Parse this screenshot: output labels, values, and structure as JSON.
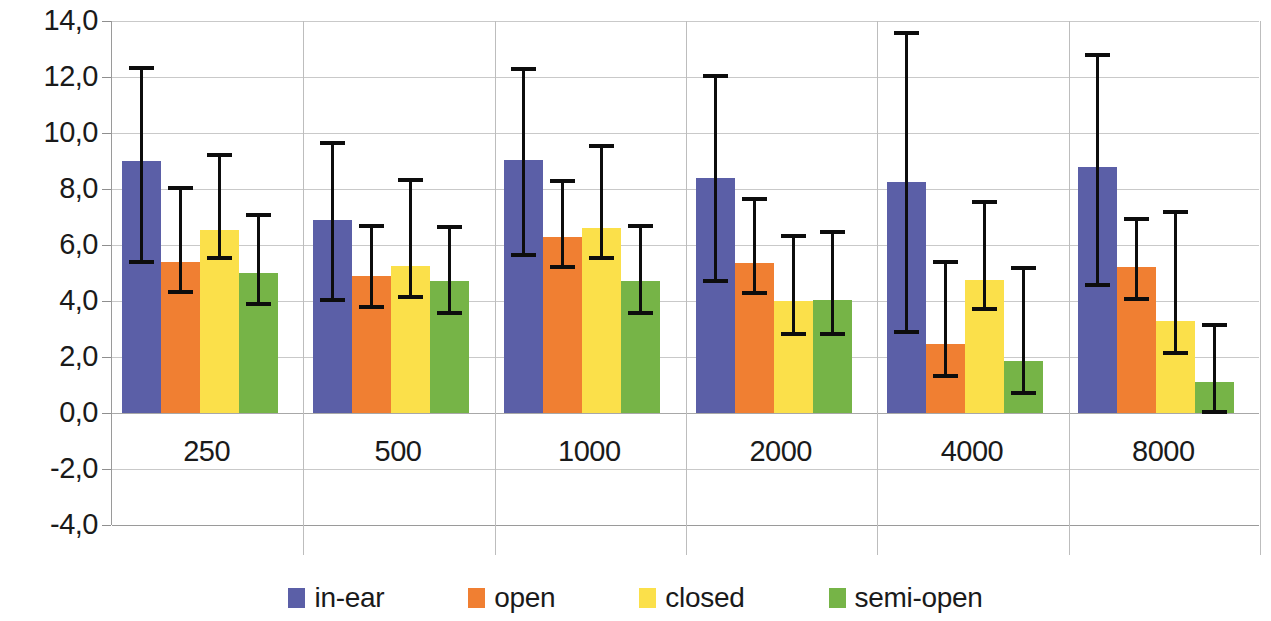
{
  "chart_data": {
    "type": "bar",
    "title": "",
    "subtitle": "",
    "xlabel": "",
    "ylabel": "",
    "categories": [
      "250",
      "500",
      "1000",
      "2000",
      "4000",
      "8000"
    ],
    "ylim": [
      -4.0,
      14.0
    ],
    "ytick_step": 2.0,
    "ytick_labels": [
      "14,0",
      "12,0",
      "10,0",
      "8,0",
      "6,0",
      "4,0",
      "2,0",
      "0,0",
      "-2,0",
      "-4,0"
    ],
    "ytick_values": [
      14.0,
      12.0,
      10.0,
      8.0,
      6.0,
      4.0,
      2.0,
      0.0,
      -2.0,
      -4.0
    ],
    "grid": true,
    "legend_position": "bottom",
    "decimal_separator": ",",
    "error_bars": "asymmetric",
    "series": [
      {
        "name": "in-ear",
        "color": "#5b5fa7",
        "values": [
          9.0,
          6.9,
          9.05,
          8.4,
          8.25,
          8.8
        ],
        "err_upper": [
          12.4,
          9.7,
          12.35,
          12.1,
          13.65,
          12.85
        ],
        "err_lower": [
          5.45,
          4.1,
          5.7,
          4.8,
          2.95,
          4.65
        ]
      },
      {
        "name": "open",
        "color": "#f07f32",
        "values": [
          5.4,
          4.9,
          6.3,
          5.35,
          2.45,
          5.2
        ],
        "err_upper": [
          8.1,
          6.75,
          8.35,
          7.7,
          5.45,
          7.0
        ],
        "err_lower": [
          4.4,
          3.85,
          5.3,
          4.35,
          1.4,
          4.15
        ]
      },
      {
        "name": "closed",
        "color": "#fbe04a",
        "values": [
          6.55,
          5.25,
          6.6,
          4.0,
          4.75,
          3.3
        ],
        "err_upper": [
          9.3,
          8.4,
          9.6,
          6.4,
          7.6,
          7.25
        ],
        "err_lower": [
          5.6,
          4.2,
          5.6,
          2.9,
          3.8,
          2.2
        ]
      },
      {
        "name": "semi-open",
        "color": "#76b447",
        "values": [
          5.0,
          4.7,
          4.7,
          4.05,
          1.85,
          1.1
        ],
        "err_upper": [
          7.15,
          6.7,
          6.75,
          6.55,
          5.25,
          3.2
        ],
        "err_lower": [
          3.95,
          3.65,
          3.65,
          2.9,
          0.8,
          0.1
        ]
      }
    ]
  },
  "legend": {
    "items": [
      {
        "label": "in-ear"
      },
      {
        "label": "open"
      },
      {
        "label": "closed"
      },
      {
        "label": "semi-open"
      }
    ]
  }
}
